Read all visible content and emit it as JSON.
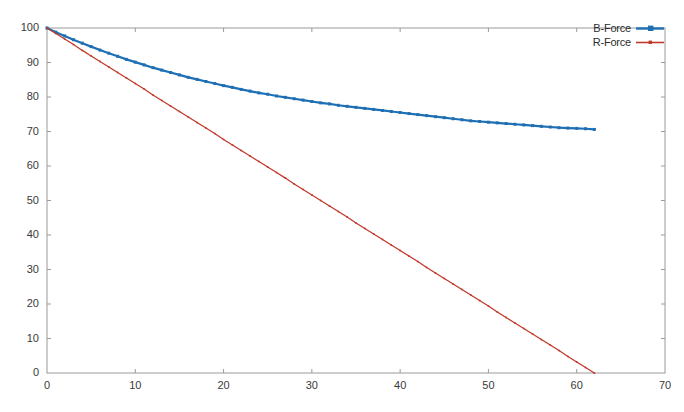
{
  "chart_data": {
    "type": "line",
    "title": "",
    "xlabel": "",
    "ylabel": "",
    "xlim": [
      0,
      70
    ],
    "ylim": [
      0,
      100
    ],
    "xticks": [
      0,
      10,
      20,
      30,
      40,
      50,
      60,
      70
    ],
    "yticks": [
      0,
      10,
      20,
      30,
      40,
      50,
      60,
      70,
      80,
      90,
      100
    ],
    "xtick_labels": [
      "0",
      "10",
      "20",
      "30",
      "40",
      "50",
      "60",
      "70"
    ],
    "ytick_labels": [
      "0",
      "10",
      "20",
      "30",
      "40",
      "50",
      "60",
      "70",
      "80",
      "90",
      "100"
    ],
    "grid": false,
    "legend_position": "top-right-inside",
    "legend_label_side": "left",
    "background_color": "#ffffff",
    "axis_color": "#9a9a9a",
    "tick_label_color": "#3a3a3a",
    "series": [
      {
        "name": "B-Force",
        "color": "#1f6fb4",
        "line_width": 2.2,
        "marker": "square",
        "marker_size": 3.0,
        "x": [
          0,
          1,
          2,
          3,
          4,
          5,
          6,
          7,
          8,
          9,
          10,
          11,
          12,
          13,
          14,
          15,
          16,
          17,
          18,
          19,
          20,
          21,
          22,
          23,
          24,
          25,
          26,
          27,
          28,
          29,
          30,
          31,
          32,
          33,
          34,
          35,
          36,
          37,
          38,
          39,
          40,
          41,
          42,
          43,
          44,
          45,
          46,
          47,
          48,
          49,
          50,
          51,
          52,
          53,
          54,
          55,
          56,
          57,
          58,
          59,
          60,
          61,
          62
        ],
        "values": [
          100.0,
          98.8,
          97.7,
          96.6,
          95.6,
          94.6,
          93.6,
          92.7,
          91.8,
          90.9,
          90.1,
          89.3,
          88.5,
          87.8,
          87.1,
          86.4,
          85.7,
          85.1,
          84.5,
          83.9,
          83.3,
          82.8,
          82.2,
          81.7,
          81.2,
          80.8,
          80.3,
          79.9,
          79.5,
          79.1,
          78.7,
          78.3,
          78.0,
          77.6,
          77.3,
          77.0,
          76.7,
          76.4,
          76.1,
          75.8,
          75.5,
          75.2,
          74.9,
          74.6,
          74.3,
          74.0,
          73.7,
          73.4,
          73.1,
          72.9,
          72.7,
          72.5,
          72.3,
          72.1,
          71.9,
          71.7,
          71.5,
          71.3,
          71.1,
          71.0,
          70.9,
          70.8,
          70.6
        ]
      },
      {
        "name": "R-Force",
        "color": "#c0392b",
        "line_width": 1.3,
        "marker": "square",
        "marker_size": 1.6,
        "x": [
          0,
          1,
          2,
          3,
          4,
          5,
          6,
          7,
          8,
          9,
          10,
          11,
          12,
          13,
          14,
          15,
          16,
          17,
          18,
          19,
          20,
          21,
          22,
          23,
          24,
          25,
          26,
          27,
          28,
          29,
          30,
          31,
          32,
          33,
          34,
          35,
          36,
          37,
          38,
          39,
          40,
          41,
          42,
          43,
          44,
          45,
          46,
          47,
          48,
          49,
          50,
          51,
          52,
          53,
          54,
          55,
          56,
          57,
          58,
          59,
          60,
          61,
          62
        ],
        "values": [
          100.0,
          98.4,
          96.8,
          95.2,
          93.5,
          91.9,
          90.3,
          88.7,
          87.1,
          85.5,
          83.9,
          82.3,
          80.6,
          79.0,
          77.4,
          75.8,
          74.2,
          72.6,
          71.0,
          69.4,
          67.7,
          66.1,
          64.5,
          62.9,
          61.3,
          59.7,
          58.1,
          56.5,
          54.8,
          53.2,
          51.6,
          50.0,
          48.4,
          46.8,
          45.2,
          43.5,
          41.9,
          40.3,
          38.7,
          37.1,
          35.5,
          33.9,
          32.3,
          30.6,
          29.0,
          27.4,
          25.8,
          24.2,
          22.6,
          21.0,
          19.4,
          17.7,
          16.1,
          14.5,
          12.9,
          11.3,
          9.7,
          8.1,
          6.5,
          4.8,
          3.2,
          1.6,
          0.0
        ]
      }
    ]
  },
  "legend": {
    "entries": [
      {
        "label": "B-Force",
        "color": "#1f6fb4"
      },
      {
        "label": "R-Force",
        "color": "#c0392b"
      }
    ]
  }
}
